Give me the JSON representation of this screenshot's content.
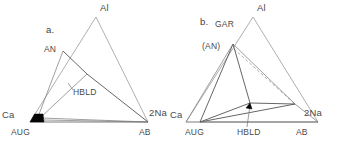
{
  "figure": {
    "type": "ternary-phase-diagram-pair",
    "background": "#ffffff",
    "line_color": "#9a9a9a",
    "tieline_color": "#555555",
    "fill_color": "#050505",
    "width": 343,
    "height": 150
  },
  "panel_a": {
    "tag": "a.",
    "vertices": {
      "apex": {
        "label": "Al",
        "x": 96,
        "y": 17,
        "label_x": 100,
        "label_y": 11
      },
      "left": {
        "label": "Ca",
        "x": 30,
        "y": 122,
        "label_x": 4,
        "label_y": 115
      },
      "right": {
        "label": "2Na",
        "x": 148,
        "y": 122,
        "label_x": 150,
        "label_y": 115
      }
    },
    "base_labels": [
      {
        "name": "AUG",
        "x": 11,
        "y": 132
      },
      {
        "name": "AB",
        "x": 140,
        "y": 132
      }
    ],
    "phase_points": [
      {
        "name": "AN",
        "x": 63,
        "y": 51,
        "label_x": 45,
        "label_y": 50
      },
      {
        "name": "HBLD",
        "x": 69,
        "y": 85,
        "label_x": 73,
        "label_y": 95
      }
    ],
    "nodes": [
      {
        "name": "junction",
        "x": 87,
        "y": 74
      }
    ],
    "augite_field": {
      "name": "AUG",
      "points": "30,122 35,114 43,114 44,122"
    },
    "tie_lines": [
      {
        "from": "AN",
        "to": "junction"
      },
      {
        "from": "junction",
        "to": "2Na-vertex"
      },
      {
        "from": "junction",
        "to": "AUG-field"
      },
      {
        "from": "AUG-field",
        "to": "AN"
      },
      {
        "from": "AUG-field",
        "to": "AB"
      }
    ],
    "tag_x": 46,
    "tag_y": 33
  },
  "panel_b": {
    "tag": "b.",
    "vertices": {
      "apex": {
        "label": "Al",
        "x": 253,
        "y": 17,
        "label_x": 257,
        "label_y": 11
      },
      "left": {
        "label": "Ca",
        "x": 186,
        "y": 122,
        "label_x": 172,
        "label_y": 115
      },
      "right": {
        "label": "2Na",
        "x": 318,
        "y": 122,
        "label_x": 305,
        "label_y": 115
      }
    },
    "base_labels": [
      {
        "name": "AUG",
        "x": 186,
        "y": 132
      },
      {
        "name": "HBLD",
        "x": 240,
        "y": 132
      },
      {
        "name": "AB",
        "x": 297,
        "y": 132
      }
    ],
    "phase_points": [
      {
        "name": "GAR",
        "x": 233,
        "y": 44,
        "label_x": 216,
        "label_y": 27
      },
      {
        "name": "(AN)",
        "x": 233,
        "y": 44,
        "label_x": 203,
        "label_y": 48
      },
      {
        "name": "HBLD",
        "x": 250,
        "y": 103,
        "label_x": 240,
        "label_y": 132
      },
      {
        "name": "AUG",
        "x": 200,
        "y": 122,
        "label_x": 186,
        "label_y": 132
      },
      {
        "name": "AB",
        "x": 295,
        "y": 104,
        "label_x": 297,
        "label_y": 132
      }
    ],
    "dashed_line": {
      "from_x": 233,
      "from_y": 48,
      "to_x": 296,
      "to_y": 105
    },
    "tie_lines": [
      {
        "from": "GAR",
        "to": "AUG"
      },
      {
        "from": "GAR",
        "to": "HBLD"
      },
      {
        "from": "AUG",
        "to": "HBLD"
      },
      {
        "from": "AUG",
        "to": "AB"
      },
      {
        "from": "HBLD",
        "to": "AB"
      },
      {
        "from": "GAR",
        "to": "AB"
      }
    ],
    "tag_x": 201,
    "tag_y": 25
  }
}
